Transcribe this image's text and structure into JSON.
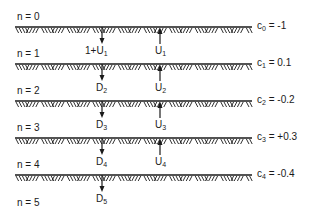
{
  "diagram": {
    "layers": [
      {
        "label": "n = 0",
        "y": 17
      },
      {
        "label": "n = 1",
        "y": 54
      },
      {
        "label": "n = 2",
        "y": 91
      },
      {
        "label": "n = 3",
        "y": 128
      },
      {
        "label": "n = 4",
        "y": 165
      },
      {
        "label": "n = 5",
        "y": 203
      }
    ],
    "interfaces": [
      {
        "y": 27,
        "coef_symbol": "c",
        "coef_index": "0",
        "coef_value": "= -1"
      },
      {
        "y": 64,
        "coef_symbol": "c",
        "coef_index": "1",
        "coef_value": "= 0.1"
      },
      {
        "y": 101,
        "coef_symbol": "c",
        "coef_index": "2",
        "coef_value": "= -0.2"
      },
      {
        "y": 138,
        "coef_symbol": "c",
        "coef_index": "3",
        "coef_value": "= +0.3"
      },
      {
        "y": 175,
        "coef_symbol": "c",
        "coef_index": "4",
        "coef_value": "= -0.4"
      }
    ],
    "down_waves": [
      {
        "base": "1+U",
        "index": "1"
      },
      {
        "base": "D",
        "index": "2"
      },
      {
        "base": "D",
        "index": "3"
      },
      {
        "base": "D",
        "index": "4"
      },
      {
        "base": "D",
        "index": "5"
      }
    ],
    "up_waves": [
      {
        "base": "U",
        "index": "1"
      },
      {
        "base": "U",
        "index": "2"
      },
      {
        "base": "U",
        "index": "3"
      },
      {
        "base": "U",
        "index": "4"
      }
    ],
    "line_x_start": 15,
    "line_x_end": 252,
    "down_arrow_x": 102,
    "up_arrow_x": 160,
    "ink_color": "#1a1a1a"
  }
}
